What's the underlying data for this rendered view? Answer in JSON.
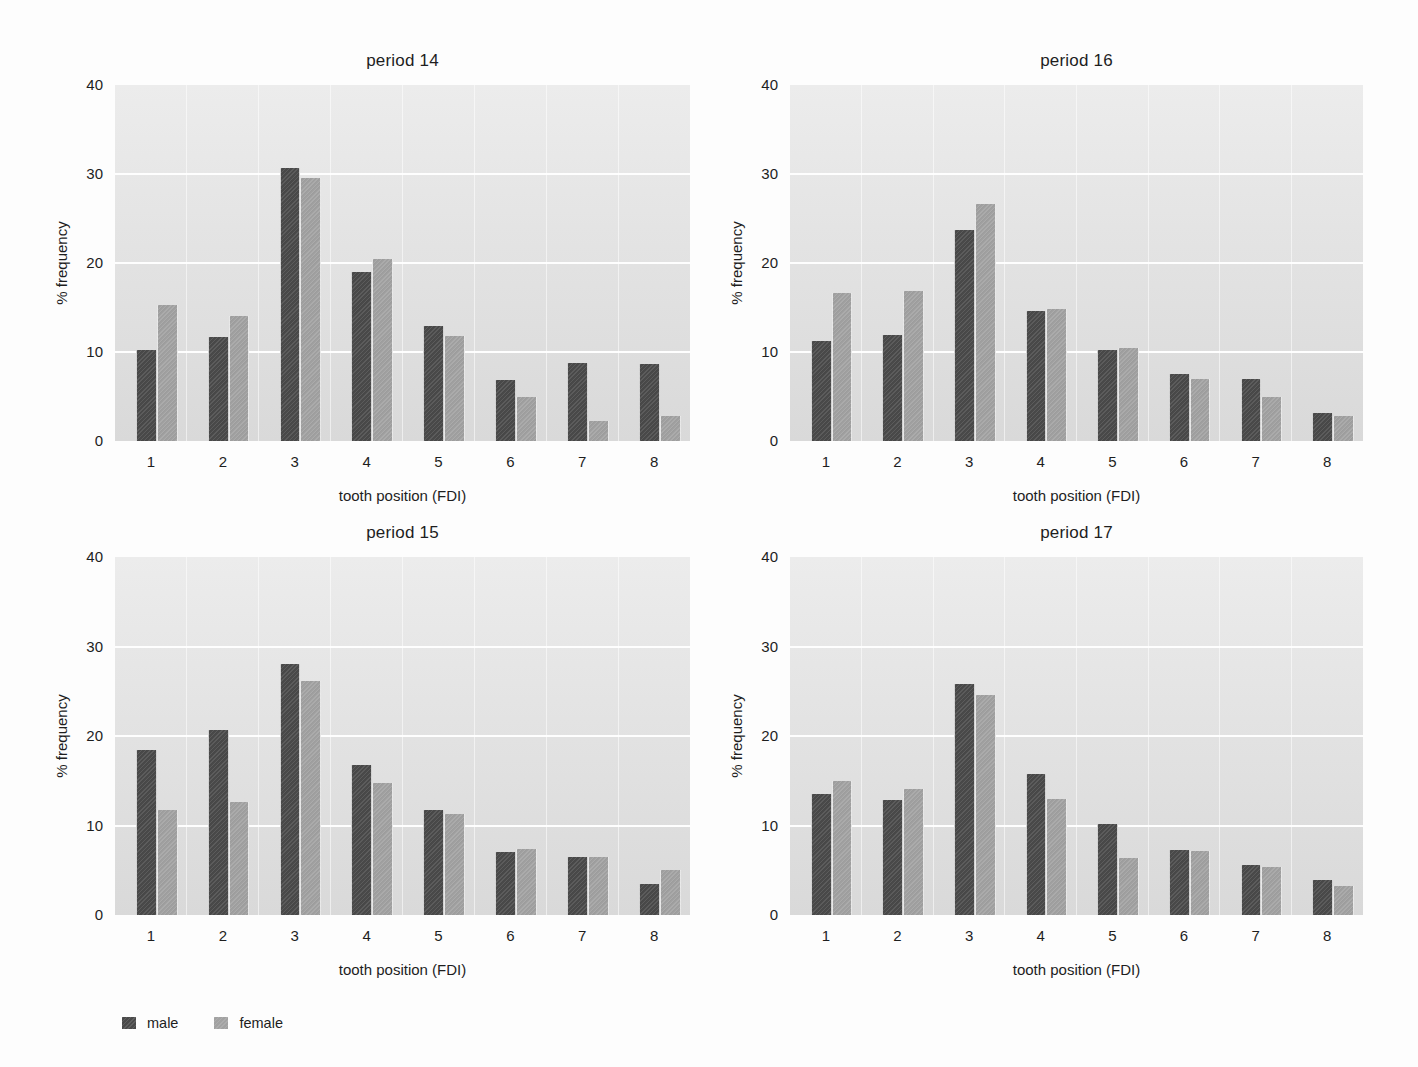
{
  "page": {
    "background": "#fdfdfd",
    "text_color": "#1e1e1e"
  },
  "colors": {
    "male": "#4a4a4a",
    "female": "#a2a2a2",
    "plot_bg_top": "#ececec",
    "plot_bg_bottom": "#d9d9d9",
    "gridline": "#ffffff"
  },
  "legend": {
    "position": "bottom-left",
    "items": [
      {
        "label": "male",
        "color": "#4a4a4a"
      },
      {
        "label": "female",
        "color": "#a2a2a2"
      }
    ]
  },
  "chart_data": [
    {
      "type": "bar",
      "title": "period 14",
      "xlabel": "tooth position (FDI)",
      "ylabel": "% frequency",
      "categories": [
        "1",
        "2",
        "3",
        "4",
        "5",
        "6",
        "7",
        "8"
      ],
      "ylim": [
        0,
        40
      ],
      "yticks": [
        0,
        10,
        20,
        30,
        40
      ],
      "gridlines": [
        10,
        20,
        30
      ],
      "grid": "horizontal-white",
      "series": [
        {
          "name": "male",
          "color": "#4a4a4a",
          "values": [
            10.2,
            11.7,
            30.7,
            19.0,
            12.9,
            6.9,
            8.8,
            8.6
          ]
        },
        {
          "name": "female",
          "color": "#a2a2a2",
          "values": [
            15.3,
            14.0,
            29.5,
            20.4,
            11.8,
            4.9,
            2.2,
            2.8
          ]
        }
      ]
    },
    {
      "type": "bar",
      "title": "period 16",
      "xlabel": "tooth position (FDI)",
      "ylabel": "% frequency",
      "categories": [
        "1",
        "2",
        "3",
        "4",
        "5",
        "6",
        "7",
        "8"
      ],
      "ylim": [
        0,
        40
      ],
      "yticks": [
        0,
        10,
        20,
        30,
        40
      ],
      "gridlines": [
        10,
        20,
        30
      ],
      "grid": "horizontal-white",
      "series": [
        {
          "name": "male",
          "color": "#4a4a4a",
          "values": [
            11.2,
            11.9,
            23.7,
            14.6,
            10.2,
            7.5,
            7.0,
            3.1
          ]
        },
        {
          "name": "female",
          "color": "#a2a2a2",
          "values": [
            16.6,
            16.8,
            26.6,
            14.8,
            10.4,
            7.0,
            5.0,
            2.8
          ]
        }
      ]
    },
    {
      "type": "bar",
      "title": "period 15",
      "xlabel": "tooth position (FDI)",
      "ylabel": "% frequency",
      "categories": [
        "1",
        "2",
        "3",
        "4",
        "5",
        "6",
        "7",
        "8"
      ],
      "ylim": [
        0,
        40
      ],
      "yticks": [
        0,
        10,
        20,
        30,
        40
      ],
      "gridlines": [
        10,
        20,
        30
      ],
      "grid": "horizontal-white",
      "series": [
        {
          "name": "male",
          "color": "#4a4a4a",
          "values": [
            18.4,
            20.7,
            28.1,
            16.8,
            11.7,
            7.0,
            6.5,
            3.5
          ]
        },
        {
          "name": "female",
          "color": "#a2a2a2",
          "values": [
            11.7,
            12.6,
            26.1,
            14.7,
            11.3,
            7.4,
            6.5,
            5.0
          ]
        }
      ]
    },
    {
      "type": "bar",
      "title": "period 17",
      "xlabel": "tooth position (FDI)",
      "ylabel": "% frequency",
      "categories": [
        "1",
        "2",
        "3",
        "4",
        "5",
        "6",
        "7",
        "8"
      ],
      "ylim": [
        0,
        40
      ],
      "yticks": [
        0,
        10,
        20,
        30,
        40
      ],
      "gridlines": [
        10,
        20,
        30
      ],
      "grid": "horizontal-white",
      "series": [
        {
          "name": "male",
          "color": "#4a4a4a",
          "values": [
            13.5,
            12.8,
            25.8,
            15.7,
            10.2,
            7.3,
            5.6,
            3.9
          ]
        },
        {
          "name": "female",
          "color": "#a2a2a2",
          "values": [
            15.0,
            14.1,
            24.6,
            13.0,
            6.4,
            7.2,
            5.4,
            3.2
          ]
        }
      ]
    }
  ]
}
